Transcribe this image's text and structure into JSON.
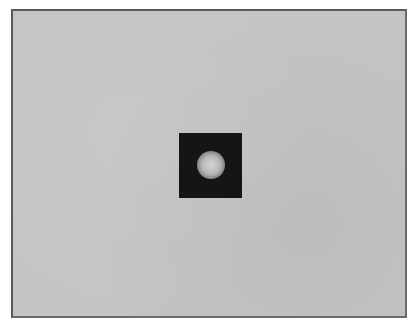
{
  "image": {
    "description": "Gray framed field with a dark square containing a soft glowing circular spot",
    "colors": {
      "frame_border": "#5a5a5a",
      "background_field": "#c4c4c4",
      "dark_square": "#151515",
      "spot": "#d6d6d6"
    }
  }
}
